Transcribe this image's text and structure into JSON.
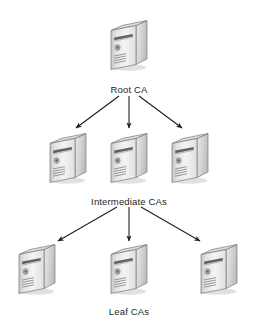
{
  "diagram": {
    "type": "tree-hierarchy",
    "background_color": "#ffffff",
    "arrow_color": "#231f20",
    "label_color": "#231f20",
    "icon": {
      "name": "server-tower-icon",
      "top_face_color": "#d9d9d9",
      "front_face_color": "#efefef",
      "side_face_color": "#c9c9c9",
      "outline_color": "#6d6d6d",
      "shadow_color": "#bfbfbf"
    },
    "tiers": [
      {
        "id": "root",
        "label": "Root CA",
        "label_x": 129,
        "label_y": 84,
        "node_count": 1,
        "nodes": [
          {
            "name": "root-ca-server",
            "x": 129,
            "y": 44
          }
        ]
      },
      {
        "id": "intermediate",
        "label": "Intermediate CAs",
        "label_x": 129,
        "label_y": 196,
        "node_count": 3,
        "nodes": [
          {
            "name": "intermediate-ca-server-1",
            "x": 68,
            "y": 157
          },
          {
            "name": "intermediate-ca-server-2",
            "x": 129,
            "y": 157
          },
          {
            "name": "intermediate-ca-server-3",
            "x": 190,
            "y": 157
          }
        ]
      },
      {
        "id": "leaf",
        "label": "Leaf CAs",
        "label_x": 129,
        "label_y": 306,
        "node_count": 3,
        "nodes": [
          {
            "name": "leaf-ca-server-1",
            "x": 37,
            "y": 268
          },
          {
            "name": "leaf-ca-server-2",
            "x": 129,
            "y": 268
          },
          {
            "name": "leaf-ca-server-3",
            "x": 219,
            "y": 268
          }
        ]
      }
    ],
    "connections": [
      {
        "name": "arrow-root-to-intermediate-1",
        "from": "root",
        "to": "intermediate-ca-server-1",
        "x1": 119,
        "y1": 96,
        "x2": 76,
        "y2": 128
      },
      {
        "name": "arrow-root-to-intermediate-2",
        "from": "root",
        "to": "intermediate-ca-server-2",
        "x1": 129,
        "y1": 96,
        "x2": 129,
        "y2": 128
      },
      {
        "name": "arrow-root-to-intermediate-3",
        "from": "root",
        "to": "intermediate-ca-server-3",
        "x1": 139,
        "y1": 96,
        "x2": 182,
        "y2": 128
      },
      {
        "name": "arrow-intermediate-to-leaf-1",
        "from": "intermediate",
        "to": "leaf-ca-server-1",
        "x1": 117,
        "y1": 207,
        "x2": 58,
        "y2": 241
      },
      {
        "name": "arrow-intermediate-to-leaf-2",
        "from": "intermediate",
        "to": "leaf-ca-server-2",
        "x1": 129,
        "y1": 207,
        "x2": 129,
        "y2": 241
      },
      {
        "name": "arrow-intermediate-to-leaf-3",
        "from": "intermediate",
        "to": "leaf-ca-server-3",
        "x1": 141,
        "y1": 207,
        "x2": 200,
        "y2": 241
      }
    ]
  }
}
